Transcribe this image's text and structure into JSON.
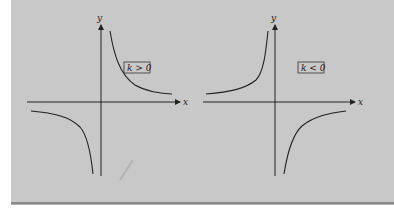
{
  "figure": {
    "background_color": "#c8c8c8",
    "line_color": "#222222",
    "graphs": [
      {
        "name": "k-positive",
        "axis_x_label": "x",
        "axis_y_label": "y",
        "condition_label": "k > 0",
        "branches": [
          "quadrant I",
          "quadrant III"
        ]
      },
      {
        "name": "k-negative",
        "axis_x_label": "x",
        "axis_y_label": "y",
        "condition_label": "k < 0",
        "branches": [
          "quadrant II",
          "quadrant IV"
        ]
      }
    ]
  }
}
